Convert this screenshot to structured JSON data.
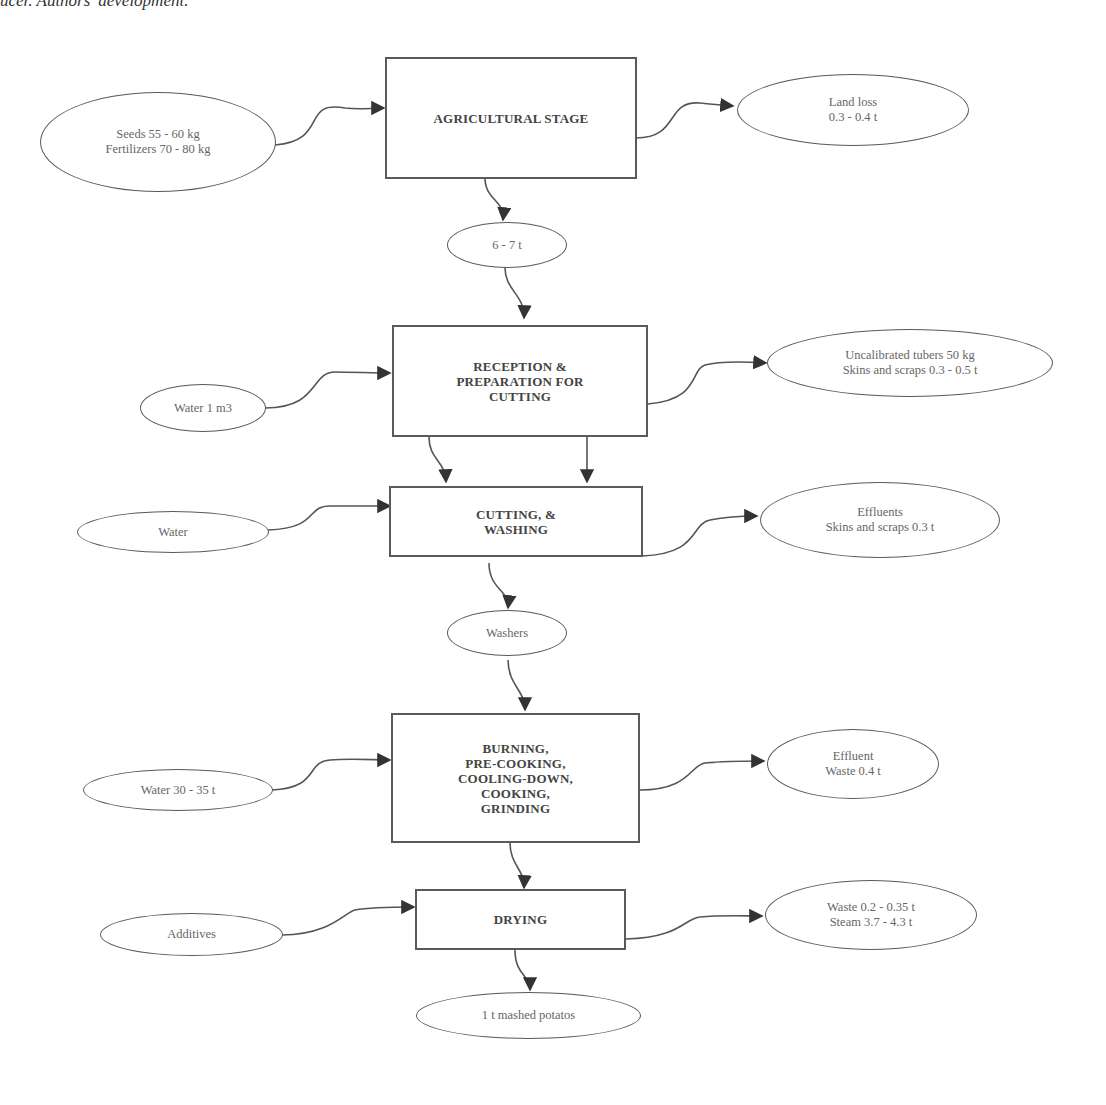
{
  "caption": "ucer. Authors' development.",
  "processes": {
    "agricultural": "AGRICULTURAL STAGE",
    "reception": [
      "RECEPTION &",
      "PREPARATION FOR",
      "CUTTING"
    ],
    "cutting": [
      "CUTTING,  &",
      "WASHING"
    ],
    "burning": [
      "BURNING,",
      "PRE-COOKING,",
      "COOLING-DOWN,",
      "COOKING,",
      "GRINDING"
    ],
    "drying": "DRYING"
  },
  "inputs": {
    "seeds": [
      "Seeds 55 - 60 kg",
      "Fertilizers 70 - 80 kg"
    ],
    "water1": "Water 1 m3",
    "water2": "Water",
    "water3": "Water 30 - 35 t",
    "additives": "Additives"
  },
  "outputs": {
    "land_loss": [
      "Land loss",
      "0.3 -  0.4 t"
    ],
    "uncalibrated": [
      "Uncalibrated tubers 50 kg",
      "Skins and scraps 0.3 - 0.5 t"
    ],
    "effluents": [
      "Effluents",
      "Skins and scraps 0.3 t"
    ],
    "effluent_waste": [
      "Effluent",
      "Waste 0.4 t"
    ],
    "waste_steam": [
      "Waste 0.2 - 0.35 t",
      "Steam 3.7 - 4.3 t"
    ]
  },
  "intermediates": {
    "tubers": "6 - 7 t",
    "washers": "Washers",
    "final": "1 t mashed potatos"
  }
}
